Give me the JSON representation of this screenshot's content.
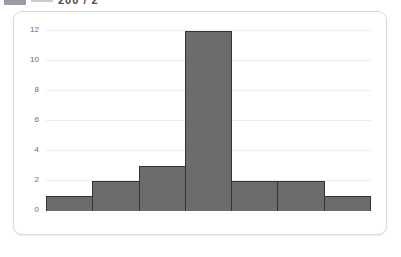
{
  "header": {
    "badge_icon": "blue-tag-icon",
    "rule_icon": "dash-icon",
    "text": "200 / 2"
  },
  "colors": {
    "bar_fill": "#6c6c6c",
    "bar_border": "#333333",
    "gridline": "#ededed",
    "axis": "#3f3f3f",
    "card_border": "#d8d8d8",
    "tick_text": "#6d6d6d"
  },
  "chart_data": {
    "type": "bar",
    "title": "",
    "subtitle": "",
    "xlabel": "",
    "ylabel": "",
    "categories": [
      "1",
      "2",
      "3",
      "4",
      "5",
      "6",
      "7"
    ],
    "values": [
      1,
      2,
      3,
      12,
      2,
      2,
      1
    ],
    "series": [
      {
        "name": "Frequency",
        "values": [
          1,
          2,
          3,
          12,
          2,
          2,
          1
        ]
      }
    ],
    "ylim": [
      0,
      12
    ],
    "ytick_values": [
      0,
      2,
      4,
      6,
      8,
      10,
      12
    ],
    "ytick_labels": [
      "0",
      "2",
      "4",
      "6",
      "8",
      "10",
      "12"
    ],
    "xtick_labels": [],
    "grid": true,
    "grid_axis": "y",
    "legend": false,
    "legend_position": "none",
    "bar_gap": 0,
    "annotations": []
  }
}
